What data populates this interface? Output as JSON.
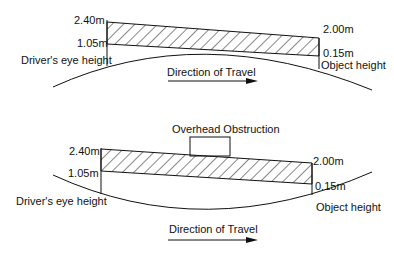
{
  "diagrams": [
    {
      "id": "crest",
      "labels": {
        "eye_top": "2.40m",
        "eye_bottom": "1.05m",
        "eye_caption": "Driver's eye height",
        "obj_top": "2.00m",
        "obj_bottom": "0.15m",
        "obj_caption": "Object height",
        "direction": "Direction of Travel"
      }
    },
    {
      "id": "sag",
      "labels": {
        "obstruction": "Overhead Obstruction",
        "eye_top": "2.40m",
        "eye_bottom": "1.05m",
        "eye_caption": "Driver's eye height",
        "obj_top": "2.00m",
        "obj_bottom": "0.15m",
        "obj_caption": "Object height",
        "direction": "Direction of Travel"
      }
    }
  ],
  "colors": {
    "line": "#111111",
    "background": "#ffffff"
  }
}
